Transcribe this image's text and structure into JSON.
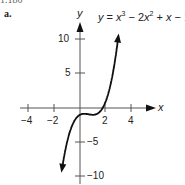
{
  "header": {
    "text": "1.180"
  },
  "part_label": "a.",
  "chart_data": {
    "type": "line",
    "title": "",
    "equation": "y = x³ − 2x² + x − 1",
    "xlabel": "x",
    "ylabel": "y",
    "xlim": [
      -4.5,
      5
    ],
    "ylim": [
      -10.5,
      11
    ],
    "x_ticks": [
      -4,
      -2,
      2,
      4
    ],
    "x_tick_labels": [
      "−4",
      "−2",
      "2",
      "4"
    ],
    "y_ticks": [
      -10,
      -5,
      5,
      10
    ],
    "y_tick_labels": [
      "−10",
      "−5",
      "5",
      "10"
    ],
    "grid": false,
    "legend": null,
    "series": [
      {
        "name": "y = x^3 - 2x^2 + x - 1",
        "x": [
          -1.4,
          -1.2,
          -1.0,
          -0.8,
          -0.6,
          -0.4,
          -0.2,
          0.0,
          0.2,
          0.4,
          0.6,
          0.8,
          1.0,
          1.2,
          1.4,
          1.6,
          1.8,
          2.0,
          2.2,
          2.4,
          2.6,
          2.8,
          3.0
        ],
        "values": [
          -10.06,
          -7.81,
          -5.0,
          -3.59,
          -2.54,
          -1.78,
          -1.29,
          -1.0,
          -0.87,
          -0.86,
          -0.9,
          -0.97,
          -1.0,
          -0.95,
          -0.78,
          -0.42,
          0.15,
          1.0,
          2.17,
          3.7,
          5.62,
          7.98,
          11.0
        ]
      }
    ]
  },
  "axes": {
    "x_label": "x",
    "y_label": "y",
    "x_tick_labels": [
      "−4",
      "−2",
      "2",
      "4"
    ],
    "y_tick_labels": {
      "p10": "10",
      "p5": "5",
      "m5": "−5",
      "m10": "−10"
    }
  },
  "equation": {
    "y": "y",
    "eq": " = ",
    "x1": "x",
    "e1": "3",
    "m1": " − 2",
    "x2": "x",
    "e2": "2",
    "p1": " + ",
    "x3": "x",
    "m2": " − 1"
  }
}
